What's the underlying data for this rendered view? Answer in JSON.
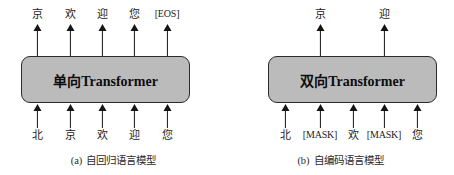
{
  "figure": {
    "panels": [
      {
        "id": "a",
        "box_label": "单向Transformer",
        "caption_tag": "(a)",
        "caption_text": "自回归语言模型",
        "inputs": [
          {
            "label": "北",
            "x": 37
          },
          {
            "label": "京",
            "x": 70
          },
          {
            "label": "欢",
            "x": 102
          },
          {
            "label": "迎",
            "x": 134
          },
          {
            "label": "您",
            "x": 167
          }
        ],
        "outputs": [
          {
            "label": "京",
            "x": 37
          },
          {
            "label": "欢",
            "x": 70
          },
          {
            "label": "迎",
            "x": 102
          },
          {
            "label": "您",
            "x": 134
          },
          {
            "label": "[EOS]",
            "x": 167
          }
        ]
      },
      {
        "id": "b",
        "box_label": "双向Transformer",
        "caption_tag": "(b)",
        "caption_text": "自编码语言模型",
        "inputs": [
          {
            "label": "北",
            "x": 58
          },
          {
            "label": "[MASK]",
            "x": 93
          },
          {
            "label": "欢",
            "x": 126
          },
          {
            "label": "[MASK]",
            "x": 157
          },
          {
            "label": "您",
            "x": 190
          }
        ],
        "outputs": [
          {
            "label": "京",
            "x": 93
          },
          {
            "label": "迎",
            "x": 157
          }
        ]
      }
    ],
    "colors": {
      "box_fill": "#bbbbbb",
      "box_stroke": "#2a2a2a",
      "arrow": "#151515",
      "text": "#222222",
      "background": "#ffffff"
    }
  }
}
